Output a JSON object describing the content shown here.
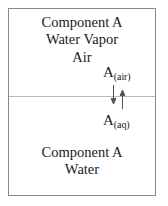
{
  "diagram": {
    "frame": {
      "border_color": "#8a8a8a",
      "background": "#ffffff"
    },
    "interface": {
      "name": "air-water-interface",
      "color": "#b9b9b9"
    },
    "vapor_phase": {
      "name": "vapor-phase-region",
      "lines": [
        "Component A",
        "Water Vapor",
        "Air"
      ]
    },
    "liquid_phase": {
      "name": "liquid-phase-region",
      "lines": [
        "Component A",
        "Water"
      ]
    },
    "species": {
      "air": {
        "base": "A",
        "subscript": "(air)",
        "full": "A(air)"
      },
      "aqueous": {
        "base": "A",
        "subscript": "(aq)",
        "full": "A(aq)"
      }
    },
    "arrows": [
      {
        "name": "absorption-arrow-down",
        "direction": "down",
        "meaning": "A(air) to A(aq)",
        "color": "#555555"
      },
      {
        "name": "volatilization-arrow-up",
        "direction": "up",
        "meaning": "A(aq) to A(air)",
        "color": "#555555"
      }
    ],
    "colors": {
      "text": "#1a1a1a",
      "border": "#8a8a8a",
      "interface": "#b9b9b9",
      "arrow": "#555555"
    }
  }
}
